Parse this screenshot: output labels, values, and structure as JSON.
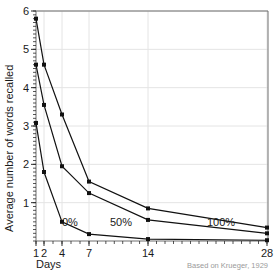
{
  "chart_data": {
    "type": "line",
    "title": "",
    "xlabel": "Days",
    "ylabel": "Average number of words recalled",
    "credit": "Based on Krueger, 1929",
    "x": [
      1,
      2,
      4,
      7,
      14,
      28
    ],
    "xtick_labels": [
      "1",
      "2",
      "4",
      "7",
      "14",
      "28"
    ],
    "ytick_labels": [
      "1",
      "2",
      "3",
      "4",
      "5",
      "6"
    ],
    "ytick_values": [
      1,
      2,
      3,
      4,
      5,
      6
    ],
    "ylim": [
      0,
      6
    ],
    "grid": true,
    "legend_position": "inline-annotations",
    "series": [
      {
        "name": "100%",
        "label": "100%",
        "values": [
          5.8,
          4.6,
          3.3,
          1.55,
          0.85,
          0.35
        ]
      },
      {
        "name": "50%",
        "label": "50%",
        "values": [
          4.6,
          3.55,
          1.95,
          1.25,
          0.55,
          0.2
        ]
      },
      {
        "name": "0%",
        "label": "0%",
        "values": [
          3.08,
          1.8,
          0.5,
          0.18,
          0.05,
          0.02
        ]
      }
    ],
    "annotations": [
      {
        "text": "0%",
        "x_px": 62,
        "y_px": 226
      },
      {
        "text": "50%",
        "x_px": 110,
        "y_px": 226
      },
      {
        "text": "100%",
        "x_px": 207,
        "y_px": 226
      }
    ]
  }
}
